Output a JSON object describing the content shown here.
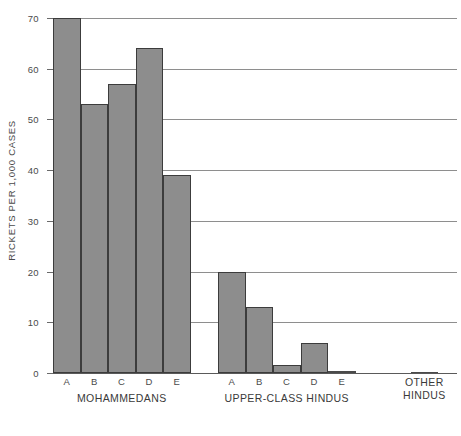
{
  "chart_data": {
    "type": "bar",
    "title": "",
    "subtitle": "",
    "xlabel": "",
    "ylabel": "RICKETS PER 1,000 CASES",
    "ylim": [
      0,
      70
    ],
    "ytick_labels": [
      "0",
      "10",
      "20",
      "30",
      "40",
      "50",
      "60",
      "70"
    ],
    "ytick_values": [
      0,
      10,
      20,
      30,
      40,
      50,
      60,
      70
    ],
    "grid": true,
    "grid_axis": "y",
    "legend": false,
    "legend_position": "none",
    "bar_color": "#8d8d8d",
    "bar_edge_color": "#3c3c3c",
    "grid_color": "#8e8e8e",
    "axis_color": "#5a5a5a",
    "categories": [
      "A",
      "B",
      "C",
      "D",
      "E",
      "A",
      "B",
      "C",
      "D",
      "E",
      "OTHER HINDUS"
    ],
    "values": [
      70,
      53,
      57,
      64,
      39,
      20,
      13,
      1.5,
      6,
      0.3,
      0.2
    ],
    "groups": [
      {
        "name": "MOHAMMEDANS",
        "label_lines": [
          "MOHAMMEDANS"
        ],
        "categories": [
          "A",
          "B",
          "C",
          "D",
          "E"
        ],
        "values": [
          70,
          53,
          57,
          64,
          39
        ]
      },
      {
        "name": "UPPER-CLASS HINDUS",
        "label_lines": [
          "UPPER-CLASS HINDUS"
        ],
        "categories": [
          "A",
          "B",
          "C",
          "D",
          "E"
        ],
        "values": [
          20,
          13,
          1.5,
          6,
          0.3
        ]
      },
      {
        "name": "OTHER HINDUS",
        "label_lines": [
          "OTHER",
          "HINDUS"
        ],
        "categories": [
          ""
        ],
        "values": [
          0.2
        ]
      }
    ]
  }
}
